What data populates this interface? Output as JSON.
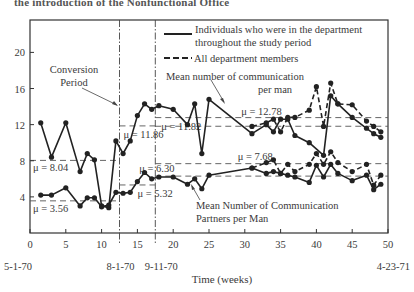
{
  "header": {
    "title_fragment": "the introduction of the Nonfunctional Office"
  },
  "chart_data": {
    "type": "line",
    "title": "",
    "xlabel": "Time  (weeks)",
    "ylabel": "",
    "xlim": [
      0,
      50
    ],
    "ylim": [
      0,
      23
    ],
    "grid": false,
    "x_ticks": [
      0,
      5,
      10,
      15,
      20,
      25,
      30,
      35,
      40,
      45,
      50
    ],
    "y_ticks": [
      4,
      8,
      12,
      16,
      20
    ],
    "date_labels": [
      {
        "x": 0,
        "label": "5-1-70"
      },
      {
        "x": 12.5,
        "label": "8-1-70"
      },
      {
        "x": 17.5,
        "label": "9-11-70"
      },
      {
        "x": 50,
        "label": "4-23-71"
      }
    ],
    "vertical_markers": [
      12.5,
      17.5
    ],
    "legend": {
      "position": "upper right",
      "entries": [
        {
          "style": "solid",
          "label_line1": "Individuals who were in the department",
          "label_line2": "throughout the study period"
        },
        {
          "style": "dashed",
          "label_line1": "All department members",
          "label_line2": ""
        }
      ]
    },
    "annotations": [
      {
        "text_line1": "Conversion",
        "text_line2": "Period"
      },
      {
        "text_line1": "Mean number of communication",
        "text_line2": "per man"
      },
      {
        "text_line1": "Mean Number of Communication",
        "text_line2": "Partners per Man"
      }
    ],
    "means": [
      {
        "label": "μ = 8.04",
        "value": 8.04,
        "x_range": [
          0,
          12.5
        ]
      },
      {
        "label": "μ = 11.86",
        "value": 11.86,
        "x_range": [
          12.5,
          17.5
        ]
      },
      {
        "label": "μ = 11.82",
        "value": 11.82,
        "x_range": [
          17.5,
          50
        ]
      },
      {
        "label": "μ = 12.78",
        "value": 12.78,
        "x_range": [
          17.5,
          50
        ]
      },
      {
        "label": "μ = 3.56",
        "value": 3.56,
        "x_range": [
          0,
          12.5
        ]
      },
      {
        "label": "μ = 5.32",
        "value": 5.32,
        "x_range": [
          12.5,
          17.5
        ]
      },
      {
        "label": "μ = 6.30",
        "value": 6.3,
        "x_range": [
          17.5,
          50
        ]
      },
      {
        "label": "μ = 7.68",
        "value": 7.68,
        "x_range": [
          17.5,
          50
        ]
      }
    ],
    "series": [
      {
        "name": "Communications per man — individuals throughout (solid)",
        "style": "solid",
        "x": [
          1.5,
          3,
          5,
          7,
          8,
          9,
          10,
          11,
          12,
          13,
          14,
          15,
          16,
          17,
          18,
          20,
          22,
          23,
          24,
          25,
          31,
          33,
          34,
          35,
          36,
          37,
          39,
          41,
          42,
          43,
          45,
          47,
          48,
          49
        ],
        "values": [
          12.2,
          8.4,
          12.2,
          6.8,
          8.8,
          8.1,
          3.0,
          2.8,
          10.2,
          8.8,
          10.2,
          13.0,
          14.3,
          13.7,
          14.1,
          13.7,
          12.0,
          14.3,
          8.8,
          14.8,
          11.0,
          12.0,
          11.2,
          12.6,
          12.6,
          10.8,
          10.0,
          8.6,
          15.2,
          14.3,
          12.8,
          11.6,
          11.0,
          10.6
        ]
      },
      {
        "name": "Communications per man — all department members (dashed)",
        "style": "dashed",
        "x": [
          31,
          33,
          34,
          35,
          36,
          37,
          39,
          40,
          41,
          42,
          43,
          45,
          47,
          48,
          49
        ],
        "values": [
          11.8,
          12.2,
          12.6,
          11.2,
          12.8,
          12.8,
          13.6,
          16.2,
          11.8,
          16.6,
          14.3,
          14.2,
          12.4,
          11.8,
          11.2
        ]
      },
      {
        "name": "Communication partners per man — individuals throughout (solid)",
        "style": "solid",
        "x": [
          1.5,
          3,
          5,
          7,
          8,
          9,
          10,
          11,
          12,
          13,
          14,
          15,
          16,
          17,
          18,
          20,
          22,
          23,
          24,
          25,
          31,
          33,
          34,
          35,
          36,
          37,
          39,
          40,
          41,
          42,
          43,
          45,
          47,
          48,
          49
        ],
        "values": [
          4.2,
          4.2,
          5.0,
          3.0,
          3.9,
          3.9,
          2.9,
          3.1,
          4.5,
          4.4,
          4.5,
          5.7,
          6.7,
          6.0,
          6.2,
          6.2,
          5.4,
          6.0,
          4.9,
          6.4,
          7.2,
          6.6,
          6.8,
          6.6,
          6.4,
          6.2,
          5.6,
          7.5,
          6.2,
          7.6,
          6.6,
          5.8,
          6.4,
          4.8,
          5.4
        ]
      },
      {
        "name": "Communication partners per man — all department members (dashed)",
        "style": "dashed",
        "x": [
          31,
          33,
          34,
          35,
          36,
          37,
          39,
          40,
          41,
          42,
          43,
          45,
          47,
          48,
          49
        ],
        "values": [
          7.2,
          7.8,
          8.1,
          6.6,
          7.6,
          6.8,
          7.6,
          8.8,
          7.6,
          9.0,
          7.8,
          6.8,
          7.6,
          5.3,
          6.4
        ]
      }
    ]
  }
}
